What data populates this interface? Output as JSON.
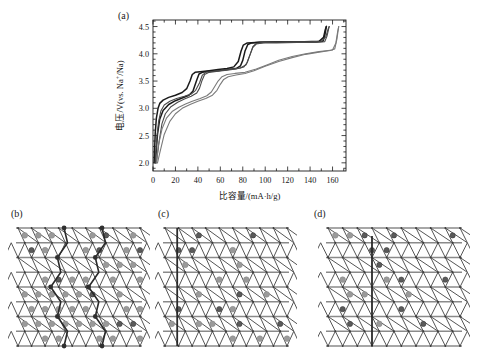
{
  "figure": {
    "panels": [
      {
        "id": "a",
        "label": "(a)",
        "kind": "chart"
      },
      {
        "id": "b",
        "label": "(b)",
        "kind": "lattice"
      },
      {
        "id": "c",
        "label": "(c)",
        "kind": "lattice"
      },
      {
        "id": "d",
        "label": "(d)",
        "kind": "lattice"
      }
    ]
  },
  "colors": {
    "curve_dark": "#1a1a1a",
    "curve_mid": "#4a4a4a",
    "curve_light": "#7a7a7a",
    "axis": "#1a1a1a",
    "lattice_line": "#555555",
    "lattice_row_line": "#8a8a8a",
    "site_dot_light": "#9a9a9a",
    "site_dot_dark": "#5a5a5a",
    "path_line": "#2a2a2a",
    "background": "#ffffff"
  },
  "chart_data": {
    "type": "line",
    "title": "",
    "xlabel": "比容量/(mA·h/g)",
    "ylabel": "电压/V(vs. Na+/Na)",
    "ylabel_parts": {
      "pre": "电压/V(vs. Na",
      "sup": "+",
      "post": "/Na)"
    },
    "xlim": [
      0,
      172
    ],
    "ylim": [
      1.85,
      4.62
    ],
    "xticks": [
      0,
      20,
      40,
      60,
      80,
      100,
      120,
      140,
      160
    ],
    "xtick_labels": [
      "0",
      "20",
      "40",
      "60",
      "80",
      "100",
      "120",
      "140",
      "160"
    ],
    "x_minor_step": 10,
    "yticks": [
      2.0,
      2.5,
      3.0,
      3.5,
      4.0,
      4.5
    ],
    "ytick_labels": [
      "2.0",
      "2.5",
      "3.0",
      "3.5",
      "4.0",
      "4.5"
    ],
    "y_minor_step": 0.1,
    "grid": false,
    "legend": null,
    "series": [
      {
        "name": "charge-cycle-1",
        "role": "charge",
        "color": "#1a1a1a",
        "width": 1.5,
        "points": [
          [
            1.0,
            2.0
          ],
          [
            2.0,
            2.55
          ],
          [
            3.0,
            2.82
          ],
          [
            4.5,
            3.0
          ],
          [
            6.0,
            3.09
          ],
          [
            9.0,
            3.15
          ],
          [
            14.0,
            3.2
          ],
          [
            20.0,
            3.24
          ],
          [
            26.0,
            3.29
          ],
          [
            30.0,
            3.36
          ],
          [
            33.0,
            3.5
          ],
          [
            35.0,
            3.62
          ],
          [
            37.5,
            3.66
          ],
          [
            42.0,
            3.67
          ],
          [
            50.0,
            3.69
          ],
          [
            58.0,
            3.71
          ],
          [
            66.0,
            3.73
          ],
          [
            72.0,
            3.76
          ],
          [
            76.0,
            3.86
          ],
          [
            78.5,
            4.05
          ],
          [
            80.5,
            4.16
          ],
          [
            84.0,
            4.2
          ],
          [
            95.0,
            4.21
          ],
          [
            115.0,
            4.22
          ],
          [
            135.0,
            4.22
          ],
          [
            148.0,
            4.23
          ],
          [
            152.0,
            4.3
          ],
          [
            153.5,
            4.44
          ],
          [
            154.5,
            4.5
          ]
        ]
      },
      {
        "name": "discharge-cycle-1",
        "role": "discharge",
        "color": "#1a1a1a",
        "width": 1.5,
        "points": [
          [
            154.5,
            4.5
          ],
          [
            153.0,
            4.33
          ],
          [
            151.5,
            4.23
          ],
          [
            146.0,
            4.22
          ],
          [
            130.0,
            4.22
          ],
          [
            110.0,
            4.21
          ],
          [
            95.0,
            4.21
          ],
          [
            88.0,
            4.2
          ],
          [
            84.5,
            4.17
          ],
          [
            82.0,
            4.05
          ],
          [
            80.0,
            3.88
          ],
          [
            78.0,
            3.78
          ],
          [
            74.0,
            3.73
          ],
          [
            66.0,
            3.71
          ],
          [
            58.0,
            3.69
          ],
          [
            50.0,
            3.68
          ],
          [
            44.0,
            3.66
          ],
          [
            41.0,
            3.63
          ],
          [
            39.0,
            3.52
          ],
          [
            37.0,
            3.4
          ],
          [
            35.5,
            3.31
          ],
          [
            32.0,
            3.24
          ],
          [
            26.0,
            3.19
          ],
          [
            20.0,
            3.14
          ],
          [
            14.0,
            3.07
          ],
          [
            9.0,
            2.96
          ],
          [
            6.0,
            2.8
          ],
          [
            4.0,
            2.52
          ],
          [
            2.5,
            2.12
          ],
          [
            2.0,
            2.0
          ]
        ]
      },
      {
        "name": "charge-cycle-2",
        "role": "charge",
        "color": "#4a4a4a",
        "width": 1.1,
        "points": [
          [
            2.0,
            2.0
          ],
          [
            3.5,
            2.48
          ],
          [
            5.0,
            2.76
          ],
          [
            7.0,
            2.95
          ],
          [
            10.0,
            3.06
          ],
          [
            15.0,
            3.13
          ],
          [
            21.0,
            3.18
          ],
          [
            28.0,
            3.22
          ],
          [
            34.0,
            3.26
          ],
          [
            38.0,
            3.33
          ],
          [
            41.5,
            3.47
          ],
          [
            44.0,
            3.61
          ],
          [
            47.0,
            3.66
          ],
          [
            54.0,
            3.68
          ],
          [
            62.0,
            3.7
          ],
          [
            70.0,
            3.72
          ],
          [
            78.0,
            3.74
          ],
          [
            83.0,
            3.8
          ],
          [
            86.5,
            3.98
          ],
          [
            89.0,
            4.13
          ],
          [
            92.0,
            4.19
          ],
          [
            100.0,
            4.21
          ],
          [
            118.0,
            4.22
          ],
          [
            138.0,
            4.22
          ],
          [
            150.0,
            4.23
          ],
          [
            154.0,
            4.31
          ],
          [
            156.0,
            4.45
          ],
          [
            157.0,
            4.5
          ]
        ]
      },
      {
        "name": "discharge-cycle-2",
        "role": "discharge",
        "color": "#4a4a4a",
        "width": 1.1,
        "points": [
          [
            157.0,
            4.5
          ],
          [
            155.0,
            4.32
          ],
          [
            153.0,
            4.22
          ],
          [
            145.0,
            4.21
          ],
          [
            128.0,
            4.21
          ],
          [
            110.0,
            4.2
          ],
          [
            98.0,
            4.2
          ],
          [
            92.0,
            4.18
          ],
          [
            89.0,
            4.12
          ],
          [
            86.5,
            3.99
          ],
          [
            84.0,
            3.84
          ],
          [
            81.0,
            3.76
          ],
          [
            74.0,
            3.72
          ],
          [
            66.0,
            3.7
          ],
          [
            58.0,
            3.68
          ],
          [
            50.0,
            3.66
          ],
          [
            46.0,
            3.62
          ],
          [
            43.5,
            3.5
          ],
          [
            41.5,
            3.37
          ],
          [
            39.0,
            3.28
          ],
          [
            34.0,
            3.22
          ],
          [
            28.0,
            3.17
          ],
          [
            22.0,
            3.11
          ],
          [
            16.0,
            3.03
          ],
          [
            11.0,
            2.9
          ],
          [
            8.0,
            2.72
          ],
          [
            5.5,
            2.4
          ],
          [
            3.5,
            2.08
          ],
          [
            2.8,
            2.0
          ]
        ]
      },
      {
        "name": "charge-cycle-3",
        "role": "charge",
        "color": "#7a7a7a",
        "width": 1.1,
        "points": [
          [
            3.0,
            2.0
          ],
          [
            5.0,
            2.34
          ],
          [
            8.0,
            2.62
          ],
          [
            12.0,
            2.82
          ],
          [
            17.0,
            2.94
          ],
          [
            23.0,
            3.02
          ],
          [
            29.0,
            3.08
          ],
          [
            35.0,
            3.13
          ],
          [
            42.0,
            3.18
          ],
          [
            48.0,
            3.23
          ],
          [
            52.0,
            3.3
          ],
          [
            55.0,
            3.4
          ],
          [
            58.0,
            3.5
          ],
          [
            61.5,
            3.58
          ],
          [
            66.0,
            3.62
          ],
          [
            73.0,
            3.64
          ],
          [
            82.0,
            3.66
          ],
          [
            92.0,
            3.72
          ],
          [
            102.0,
            3.8
          ],
          [
            112.0,
            3.88
          ],
          [
            124.0,
            3.95
          ],
          [
            136.0,
            4.0
          ],
          [
            148.0,
            4.04
          ],
          [
            156.0,
            4.06
          ],
          [
            160.0,
            4.07
          ],
          [
            163.0,
            4.2
          ],
          [
            164.5,
            4.4
          ],
          [
            165.5,
            4.5
          ]
        ]
      },
      {
        "name": "discharge-cycle-3",
        "role": "discharge",
        "color": "#7a7a7a",
        "width": 1.1,
        "points": [
          [
            165.5,
            4.5
          ],
          [
            164.0,
            4.28
          ],
          [
            162.0,
            4.09
          ],
          [
            158.0,
            4.06
          ],
          [
            148.0,
            4.03
          ],
          [
            136.0,
            3.99
          ],
          [
            124.0,
            3.93
          ],
          [
            112.0,
            3.86
          ],
          [
            100.0,
            3.77
          ],
          [
            90.0,
            3.69
          ],
          [
            82.0,
            3.64
          ],
          [
            74.0,
            3.61
          ],
          [
            67.0,
            3.58
          ],
          [
            63.0,
            3.53
          ],
          [
            60.0,
            3.44
          ],
          [
            57.0,
            3.33
          ],
          [
            53.0,
            3.24
          ],
          [
            47.0,
            3.18
          ],
          [
            40.0,
            3.13
          ],
          [
            33.0,
            3.07
          ],
          [
            26.0,
            3.0
          ],
          [
            20.0,
            2.9
          ],
          [
            15.0,
            2.76
          ],
          [
            10.0,
            2.52
          ],
          [
            6.0,
            2.18
          ],
          [
            4.0,
            2.0
          ]
        ]
      }
    ]
  },
  "lattices": {
    "b": {
      "label": "(b)",
      "cols": 9,
      "rows": 8,
      "overlay": "zigzag-double-path",
      "description": "triangular lattice with occupied sites and two zigzag domain-wall paths"
    },
    "c": {
      "label": "(c)",
      "cols": 9,
      "rows": 8,
      "overlay": "vertical-line-left",
      "description": "triangular lattice with a single straight vertical domain wall near the left edge"
    },
    "d": {
      "label": "(d)",
      "cols": 9,
      "rows": 8,
      "overlay": "vertical-line-center",
      "description": "triangular lattice with a single straight vertical domain wall toward the centre"
    }
  }
}
